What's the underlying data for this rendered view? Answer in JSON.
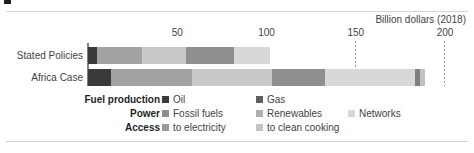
{
  "figure": {
    "title_fragment": "",
    "axis_caption": "Billion dollars (2018)"
  },
  "chart_data": {
    "type": "bar",
    "orientation": "horizontal",
    "stacked": true,
    "title": "",
    "xlabel": "Billion dollars (2018)",
    "ylabel": "",
    "xlim": [
      0,
      200
    ],
    "xticks": [
      50,
      100,
      150,
      200
    ],
    "xticklabels": [
      "50",
      "100",
      "150",
      "200"
    ],
    "grid": "vertical dotted at 150 and 200",
    "legend_position": "below",
    "categories": [
      "Stated Policies",
      "Africa Case"
    ],
    "series": [
      {
        "name": "Oil",
        "group": "Fuel production",
        "color": "#3a3a3a",
        "values": [
          5,
          13
        ]
      },
      {
        "name": "Gas",
        "group": "Fuel production",
        "color": "#a3a3a3",
        "values": [
          25,
          45
        ]
      },
      {
        "name": "Fossil fuels",
        "group": "Power",
        "color": "#c9c9c9",
        "values": [
          25,
          45
        ]
      },
      {
        "name": "Renewables",
        "group": "Power",
        "color": "#8f8f8f",
        "values": [
          27,
          30
        ]
      },
      {
        "name": "Networks",
        "group": "Power",
        "color": "#d8d8d8",
        "values": [
          20,
          50
        ]
      },
      {
        "name": "to electricity",
        "group": "Access",
        "color": "#7f7f7f",
        "values": [
          0,
          3
        ]
      },
      {
        "name": "to clean cooking",
        "group": "Access",
        "color": "#c0c0c0",
        "values": [
          0,
          3
        ]
      }
    ],
    "totals": [
      102,
      189
    ]
  },
  "ticks": [
    {
      "label": "50",
      "value": 50
    },
    {
      "label": "100",
      "value": 100
    },
    {
      "label": "150",
      "value": 150
    },
    {
      "label": "200",
      "value": 200
    }
  ],
  "gridlines": [
    150,
    200
  ],
  "bars": [
    {
      "label": "Stated Policies",
      "segments": [
        {
          "name": "Oil",
          "value": 5,
          "color": "#3a3a3a"
        },
        {
          "name": "Gas",
          "value": 25,
          "color": "#a3a3a3"
        },
        {
          "name": "Fossil fuels",
          "value": 25,
          "color": "#c9c9c9"
        },
        {
          "name": "Renewables",
          "value": 27,
          "color": "#8f8f8f"
        },
        {
          "name": "Networks",
          "value": 20,
          "color": "#d8d8d8"
        }
      ]
    },
    {
      "label": "Africa Case",
      "segments": [
        {
          "name": "Oil",
          "value": 13,
          "color": "#3a3a3a"
        },
        {
          "name": "Gas",
          "value": 45,
          "color": "#a3a3a3"
        },
        {
          "name": "Fossil fuels",
          "value": 45,
          "color": "#c9c9c9"
        },
        {
          "name": "Renewables",
          "value": 30,
          "color": "#8f8f8f"
        },
        {
          "name": "Networks",
          "value": 50,
          "color": "#d8d8d8"
        },
        {
          "name": "to electricity",
          "value": 3,
          "color": "#7f7f7f"
        },
        {
          "name": "to clean cooking",
          "value": 3,
          "color": "#c0c0c0"
        }
      ]
    }
  ],
  "legend": {
    "rows": [
      {
        "heading": "Fuel production",
        "items": [
          {
            "label": "Oil",
            "color": "#3a3a3a",
            "x": 162
          },
          {
            "label": "Gas",
            "color": "#5f5f5f",
            "x": 256
          }
        ]
      },
      {
        "heading": "Power",
        "items": [
          {
            "label": "Fossil fuels",
            "color": "#8f8f8f",
            "x": 162
          },
          {
            "label": "Renewables",
            "color": "#b0b0b0",
            "x": 256
          },
          {
            "label": "Networks",
            "color": "#d8d8d8",
            "x": 348
          }
        ]
      },
      {
        "heading": "Access",
        "items": [
          {
            "label": "to electricity",
            "color": "#9a9a9a",
            "x": 162
          },
          {
            "label": "to clean cooking",
            "color": "#c4c4c4",
            "x": 256
          }
        ]
      }
    ]
  }
}
